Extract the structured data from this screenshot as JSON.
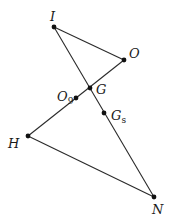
{
  "diagram": {
    "type": "geometry",
    "points": [
      {
        "id": "I",
        "label": "I",
        "sub": "",
        "x": 54,
        "y": 27,
        "lx": 50,
        "ly": 21
      },
      {
        "id": "O",
        "label": "O",
        "sub": "",
        "x": 124,
        "y": 60,
        "lx": 129,
        "ly": 58
      },
      {
        "id": "G",
        "label": "G",
        "sub": "",
        "x": 90,
        "y": 88,
        "lx": 96,
        "ly": 94
      },
      {
        "id": "O9",
        "label": "O",
        "sub": "9",
        "x": 76,
        "y": 98,
        "lx": 57,
        "ly": 101
      },
      {
        "id": "Gs",
        "label": "G",
        "sub": "s",
        "x": 104,
        "y": 113,
        "lx": 111,
        "ly": 120
      },
      {
        "id": "H",
        "label": "H",
        "sub": "",
        "x": 28,
        "y": 136,
        "lx": 8,
        "ly": 148
      },
      {
        "id": "N",
        "label": "N",
        "sub": "",
        "x": 154,
        "y": 197,
        "lx": 152,
        "ly": 214
      }
    ],
    "segments": [
      {
        "from": "I",
        "to": "O",
        "x1": 54,
        "y1": 27,
        "x2": 124,
        "y2": 60
      },
      {
        "from": "I",
        "to": "N",
        "x1": 54,
        "y1": 27,
        "x2": 154,
        "y2": 197
      },
      {
        "from": "H",
        "to": "O",
        "x1": 28,
        "y1": 136,
        "x2": 124,
        "y2": 60
      },
      {
        "from": "H",
        "to": "N",
        "x1": 28,
        "y1": 136,
        "x2": 154,
        "y2": 197
      }
    ]
  }
}
